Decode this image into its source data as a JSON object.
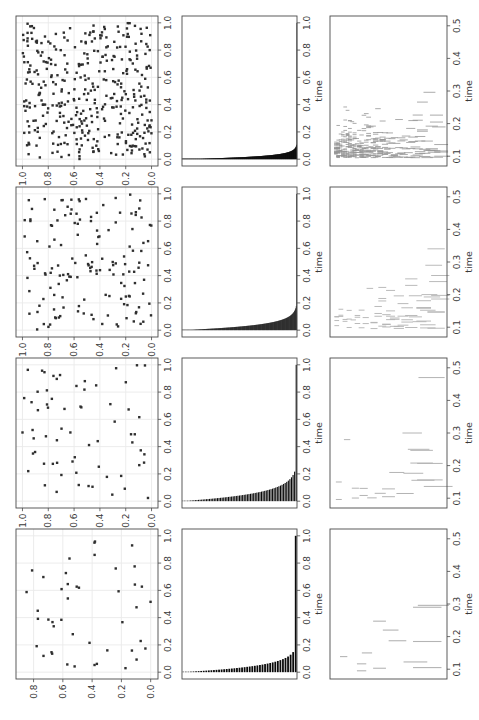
{
  "figure": {
    "background": "#ffffff",
    "spine_color": "#4a4a4a",
    "tick_color": "#4a4a4a",
    "text_color": "#3a3a3a",
    "grid_color": "#eaeaea",
    "rotation_deg": -90,
    "xlabel_text": "time"
  },
  "chart_data": [
    {
      "id": "scatter-c1",
      "type": "scatter",
      "row": 0,
      "col": 0,
      "seed": 101,
      "n": 44,
      "xlim": [
        -0.05,
        1.05
      ],
      "ylim": [
        -0.05,
        0.92
      ],
      "data_ymax": 0.88,
      "xtick_values": [
        0,
        0.2,
        0.4,
        0.6,
        0.8,
        1.0
      ],
      "xtick_labels": [
        "0.0",
        "0.2",
        "0.4",
        "0.6",
        "0.8",
        "1.0"
      ],
      "ytick_values": [
        0,
        0.2,
        0.4,
        0.6,
        0.8
      ],
      "ytick_labels": [
        "0.0",
        "0.2",
        "0.4",
        "0.6",
        "0.8"
      ],
      "xlabel": "",
      "grid": true,
      "marker": "square",
      "marker_px": 2.4,
      "color": "#2f2f2f"
    },
    {
      "id": "scatter-c2",
      "type": "scatter",
      "row": 0,
      "col": 1,
      "seed": 102,
      "n": 66,
      "xlim": [
        -0.05,
        1.05
      ],
      "ylim": [
        -0.05,
        1.05
      ],
      "data_ymax": 1.0,
      "xtick_values": [
        0,
        0.2,
        0.4,
        0.6,
        0.8,
        1.0
      ],
      "xtick_labels": [
        "0.0",
        "0.2",
        "0.4",
        "0.6",
        "0.8",
        "1.0"
      ],
      "ytick_values": [
        0,
        0.2,
        0.4,
        0.6,
        0.8,
        1.0
      ],
      "ytick_labels": [
        "0.0",
        "0.2",
        "0.4",
        "0.6",
        "0.8",
        "1.0"
      ],
      "xlabel": "",
      "grid": true,
      "marker": "square",
      "marker_px": 2.4,
      "color": "#2f2f2f"
    },
    {
      "id": "scatter-c3",
      "type": "scatter",
      "row": 0,
      "col": 2,
      "seed": 103,
      "n": 152,
      "xlim": [
        -0.05,
        1.05
      ],
      "ylim": [
        -0.05,
        1.05
      ],
      "data_ymax": 1.0,
      "xtick_values": [
        0,
        0.2,
        0.4,
        0.6,
        0.8,
        1.0
      ],
      "xtick_labels": [
        "0.0",
        "0.2",
        "0.4",
        "0.6",
        "0.8",
        "1.0"
      ],
      "ytick_values": [
        0,
        0.2,
        0.4,
        0.6,
        0.8,
        1.0
      ],
      "ytick_labels": [
        "0.0",
        "0.2",
        "0.4",
        "0.6",
        "0.8",
        "1.0"
      ],
      "xlabel": "",
      "grid": true,
      "marker": "square",
      "marker_px": 2.4,
      "color": "#2f2f2f"
    },
    {
      "id": "scatter-c4",
      "type": "scatter",
      "row": 0,
      "col": 3,
      "seed": 104,
      "n": 392,
      "xlim": [
        -0.05,
        1.05
      ],
      "ylim": [
        -0.05,
        1.05
      ],
      "data_ymax": 1.0,
      "xtick_values": [
        0,
        0.2,
        0.4,
        0.6,
        0.8,
        1.0
      ],
      "xtick_labels": [
        "0.0",
        "0.2",
        "0.4",
        "0.6",
        "0.8",
        "1.0"
      ],
      "ytick_values": [
        0,
        0.2,
        0.4,
        0.6,
        0.8,
        1.0
      ],
      "ytick_labels": [
        "0.0",
        "0.2",
        "0.4",
        "0.6",
        "0.8",
        "1.0"
      ],
      "xlabel": "",
      "grid": true,
      "marker": "square",
      "marker_px": 2.4,
      "color": "#2f2f2f"
    },
    {
      "id": "bars-c1",
      "type": "barh",
      "row": 1,
      "col": 0,
      "seed": 201,
      "n": 44,
      "scale": 0.047,
      "final_bar": 1.0,
      "xlim": [
        -0.05,
        1.05
      ],
      "xtick_values": [
        0,
        0.2,
        0.4,
        0.6,
        0.8,
        1.0
      ],
      "xtick_labels": [
        "0.0",
        "0.2",
        "0.4",
        "0.6",
        "0.8",
        "1.0"
      ],
      "xlabel": "time",
      "color": "#0a0a0a"
    },
    {
      "id": "bars-c2",
      "type": "barh",
      "row": 1,
      "col": 1,
      "seed": 202,
      "n": 72,
      "scale": 0.06,
      "final_bar": 1.0,
      "xlim": [
        -0.05,
        1.05
      ],
      "xtick_values": [
        0,
        0.2,
        0.4,
        0.6,
        0.8,
        1.0
      ],
      "xtick_labels": [
        "0.0",
        "0.2",
        "0.4",
        "0.6",
        "0.8",
        "1.0"
      ],
      "xlabel": "time",
      "color": "#0a0a0a"
    },
    {
      "id": "bars-c3",
      "type": "barh",
      "row": 1,
      "col": 2,
      "seed": 203,
      "n": 200,
      "scale": 0.038,
      "final_bar": 1.0,
      "xlim": [
        -0.05,
        1.05
      ],
      "xtick_values": [
        0,
        0.2,
        0.4,
        0.6,
        0.8,
        1.0
      ],
      "xtick_labels": [
        "0.0",
        "0.2",
        "0.4",
        "0.6",
        "0.8",
        "1.0"
      ],
      "xlabel": "time",
      "color": "#0a0a0a"
    },
    {
      "id": "bars-c4",
      "type": "barh",
      "row": 1,
      "col": 3,
      "seed": 204,
      "n": 400,
      "scale": 0.02,
      "final_bar": 1.0,
      "xlim": [
        -0.05,
        1.05
      ],
      "xtick_values": [
        0,
        0.2,
        0.4,
        0.6,
        0.8,
        1.0
      ],
      "xtick_labels": [
        "0.0",
        "0.2",
        "0.4",
        "0.6",
        "0.8",
        "1.0"
      ],
      "xlabel": "time",
      "color": "#0a0a0a"
    },
    {
      "id": "events-c1",
      "type": "eventplot",
      "row": 2,
      "col": 0,
      "seed": 301,
      "rows": 6,
      "rate": 1.5,
      "len_min": 0.06,
      "len_max": 0.3,
      "tmax": 0.3,
      "tspread": 0.045,
      "stroke_w": 1.1,
      "color": "#b4b4b4",
      "xlim": [
        0.07,
        0.53
      ],
      "xtick_values": [
        0.1,
        0.2,
        0.3,
        0.4,
        0.5
      ],
      "xtick_labels": [
        "0.1",
        "0.2",
        "0.3",
        "0.4",
        "0.5"
      ],
      "xlabel": "time",
      "dense_top": false,
      "extra_events": [
        {
          "f": 0.86,
          "t": 0.29
        },
        {
          "f": 0.86,
          "t": 0.185
        },
        {
          "f": 0.86,
          "t": 0.105
        },
        {
          "f": 0.52,
          "t": 0.22
        },
        {
          "f": 0.3,
          "t": 0.15
        }
      ]
    },
    {
      "id": "events-c2",
      "type": "eventplot",
      "row": 2,
      "col": 1,
      "seed": 302,
      "rows": 13,
      "rate": 1.4,
      "len_min": 0.05,
      "len_max": 0.26,
      "tmax": 0.34,
      "tspread": 0.05,
      "stroke_w": 1.0,
      "color": "#b4b4b4",
      "xlim": [
        0.07,
        0.53
      ],
      "xtick_values": [
        0.1,
        0.2,
        0.3,
        0.4,
        0.5
      ],
      "xtick_labels": [
        "0.1",
        "0.2",
        "0.3",
        "0.4",
        "0.5"
      ],
      "xlabel": "time",
      "dense_top": false,
      "extra_events": [
        {
          "f": 0.9,
          "t": 0.47
        },
        {
          "f": 0.72,
          "t": 0.3
        },
        {
          "f": 0.78,
          "t": 0.25
        },
        {
          "f": 0.82,
          "t": 0.155
        }
      ]
    },
    {
      "id": "events-c3",
      "type": "eventplot",
      "row": 2,
      "col": 2,
      "seed": 303,
      "rows": 26,
      "rate": 2.6,
      "len_min": 0.04,
      "len_max": 0.16,
      "tmax": 0.37,
      "tspread": 0.05,
      "stroke_w": 0.9,
      "color": "#b2b2b2",
      "xlim": [
        0.07,
        0.53
      ],
      "xtick_values": [
        0.1,
        0.2,
        0.3,
        0.4,
        0.5
      ],
      "xtick_labels": [
        "0.1",
        "0.2",
        "0.3",
        "0.4",
        "0.5"
      ],
      "xlabel": "time",
      "dense_top": false,
      "extra_events": [
        {
          "f": 0.92,
          "t": 0.29
        },
        {
          "f": 0.96,
          "t": 0.24
        },
        {
          "f": 0.88,
          "t": 0.2
        }
      ]
    },
    {
      "id": "events-c4",
      "type": "eventplot",
      "row": 2,
      "col": 3,
      "seed": 304,
      "rows": 46,
      "rate": 3,
      "len_min": 0.03,
      "len_max": 0.12,
      "tmax": 0.42,
      "tspread": 0.042,
      "stroke_w": 0.8,
      "color": "#969696",
      "xlim": [
        0.07,
        0.53
      ],
      "xtick_values": [
        0.1,
        0.2,
        0.3,
        0.4,
        0.5
      ],
      "xtick_labels": [
        "0.1",
        "0.2",
        "0.3",
        "0.4",
        "0.5"
      ],
      "xlabel": "time",
      "dense_top": true,
      "extra_events": []
    }
  ]
}
